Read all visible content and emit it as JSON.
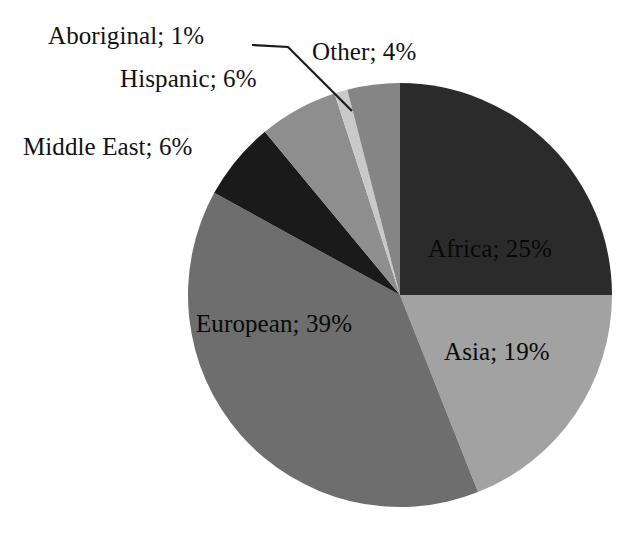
{
  "chart_data": {
    "type": "pie",
    "title": "",
    "subtitle": "",
    "xlabel": "",
    "ylabel": "",
    "legend_position": "none",
    "grid": false,
    "label_format": "name; value%",
    "start_angle_deg": 0,
    "direction": "clockwise",
    "categories": [
      "Africa",
      "Asia",
      "European",
      "Middle East",
      "Hispanic",
      "Aboriginal",
      "Other"
    ],
    "values": [
      25,
      19,
      39,
      6,
      6,
      1,
      4
    ],
    "units": "%",
    "total": 100,
    "slices": [
      {
        "name": "Africa",
        "label": "Africa; 25%",
        "value": 25,
        "color": "#2b2b2b",
        "label_placement": "inside",
        "start_angle_deg": 0,
        "end_angle_deg": 90
      },
      {
        "name": "Asia",
        "label": "Asia; 19%",
        "value": 19,
        "color": "#a2a2a2",
        "label_placement": "inside",
        "start_angle_deg": 90,
        "end_angle_deg": 158.4
      },
      {
        "name": "European",
        "label": "European; 39%",
        "value": 39,
        "color": "#6e6e6e",
        "label_placement": "inside",
        "start_angle_deg": 158.4,
        "end_angle_deg": 298.8
      },
      {
        "name": "Middle East",
        "label": "Middle East; 6%",
        "value": 6,
        "color": "#1a1a1a",
        "label_placement": "outside",
        "start_angle_deg": 298.8,
        "end_angle_deg": 320.4
      },
      {
        "name": "Hispanic",
        "label": "Hispanic; 6%",
        "value": 6,
        "color": "#8e8e8e",
        "label_placement": "outside",
        "start_angle_deg": 320.4,
        "end_angle_deg": 342.0
      },
      {
        "name": "Aboriginal",
        "label": "Aboriginal; 1%",
        "value": 1,
        "color": "#c9c9c9",
        "label_placement": "outside-leader",
        "start_angle_deg": 342.0,
        "end_angle_deg": 345.6
      },
      {
        "name": "Other",
        "label": "Other; 4%",
        "value": 4,
        "color": "#858585",
        "label_placement": "outside",
        "start_angle_deg": 345.6,
        "end_angle_deg": 360.0
      }
    ]
  },
  "labels": {
    "africa": "Africa; 25%",
    "asia": "Asia; 19%",
    "european": "European; 39%",
    "middle_east": "Middle East; 6%",
    "hispanic": "Hispanic; 6%",
    "aboriginal": "Aboriginal; 1%",
    "other": "Other; 4%"
  },
  "colors": {
    "background": "#ffffff",
    "text": "#111111",
    "leader_line": "#1a1a1a",
    "africa": "#2b2b2b",
    "asia": "#a2a2a2",
    "european": "#6e6e6e",
    "middle_east": "#1a1a1a",
    "hispanic": "#8e8e8e",
    "aboriginal": "#c9c9c9",
    "other": "#858585"
  },
  "geometry": {
    "center_x": 400,
    "center_y": 295,
    "radius": 212
  }
}
